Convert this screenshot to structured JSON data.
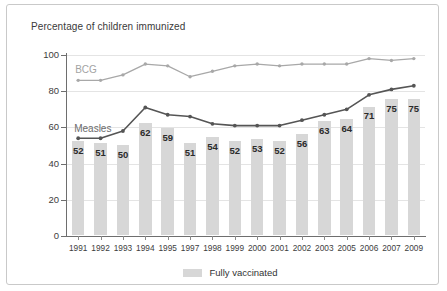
{
  "chart_data": {
    "type": "bar",
    "title": "Percentage of children immunized",
    "xlabel": "",
    "ylabel": "",
    "ylim": [
      0,
      100
    ],
    "yticks": [
      0,
      20,
      40,
      60,
      80,
      100
    ],
    "grid": true,
    "legend_position": "bottom",
    "categories": [
      "1991",
      "1992",
      "1993",
      "1994",
      "1995",
      "1997",
      "1998",
      "1999",
      "2000",
      "2001",
      "2002",
      "2003",
      "2005",
      "2006",
      "2007",
      "2009"
    ],
    "bars": {
      "name": "Fully vaccinated",
      "color": "#d7d7d7",
      "values": [
        52,
        51,
        50,
        62,
        59,
        51,
        54,
        52,
        53,
        52,
        56,
        63,
        64,
        71,
        75,
        75
      ]
    },
    "series": [
      {
        "name": "BCG",
        "color": "#a8a8a8",
        "marker": "circle",
        "values": [
          86,
          86,
          89,
          95,
          94,
          88,
          91,
          94,
          95,
          94,
          95,
          95,
          95,
          98,
          97,
          98
        ]
      },
      {
        "name": "Measles",
        "color": "#555555",
        "marker": "circle",
        "values": [
          54,
          54,
          58,
          71,
          67,
          66,
          62,
          61,
          61,
          61,
          64,
          67,
          70,
          78,
          81,
          83
        ]
      }
    ],
    "legend": [
      {
        "label": "Fully vaccinated",
        "color": "#d7d7d7"
      }
    ],
    "annotations": [
      {
        "text": "BCG",
        "series": "BCG"
      },
      {
        "text": "Measles",
        "series": "Measles"
      }
    ]
  }
}
